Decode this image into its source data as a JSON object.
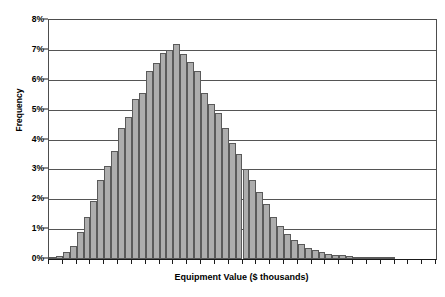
{
  "chart_data": {
    "type": "bar",
    "title": "",
    "xlabel": "Equipment Value ($ thousands)",
    "ylabel": "Frequency",
    "ylim": [
      0,
      8
    ],
    "y_unit": "%",
    "ytick_labels": [
      "0%",
      "1%",
      "2%",
      "3%",
      "4%",
      "5%",
      "6%",
      "7%",
      "8%"
    ],
    "ytick_values": [
      0,
      1,
      2,
      3,
      4,
      5,
      6,
      7,
      8
    ],
    "xtick_labels": [],
    "grid": "horizontal",
    "legend": "none",
    "bar_fill": "#adadad",
    "bar_border": "#5a5a5a",
    "plot_border": "#4d4d4d",
    "gridline_color": "#555555",
    "n_bins": 50,
    "categories": [
      "1",
      "2",
      "3",
      "4",
      "5",
      "6",
      "7",
      "8",
      "9",
      "10",
      "11",
      "12",
      "13",
      "14",
      "15",
      "16",
      "17",
      "18",
      "19",
      "20",
      "21",
      "22",
      "23",
      "24",
      "25",
      "26",
      "27",
      "28",
      "29",
      "30",
      "31",
      "32",
      "33",
      "34",
      "35",
      "36",
      "37",
      "38",
      "39",
      "40",
      "41",
      "42",
      "43",
      "44",
      "45",
      "46",
      "47",
      "48",
      "49",
      "50"
    ],
    "values": [
      0.05,
      0.1,
      0.22,
      0.45,
      0.9,
      1.4,
      1.95,
      2.65,
      3.1,
      3.6,
      4.4,
      4.75,
      5.35,
      5.55,
      6.3,
      6.55,
      6.9,
      7.0,
      7.2,
      6.85,
      6.6,
      6.3,
      5.55,
      5.2,
      4.9,
      4.4,
      3.9,
      3.5,
      3.0,
      2.65,
      2.25,
      1.85,
      1.4,
      1.1,
      0.85,
      0.62,
      0.5,
      0.38,
      0.3,
      0.22,
      0.18,
      0.14,
      0.12,
      0.1,
      0.08,
      0.07,
      0.06,
      0.05,
      0.04,
      0.03
    ]
  },
  "axes": {
    "y_title": "Frequency",
    "x_title": "Equipment Value ($ thousands)"
  }
}
